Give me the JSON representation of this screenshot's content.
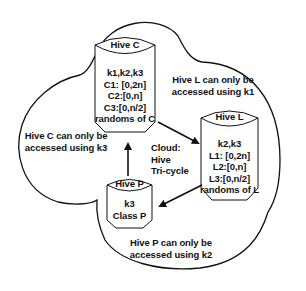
{
  "diagram": {
    "cloud_label": [
      "Cloud:",
      "Hive",
      "Tri-cycle"
    ],
    "hives": [
      {
        "id": "C",
        "title": "Hive C",
        "contents": [
          "k1,k2,k3",
          "C1: [0,2n]",
          "C2:[0,n]",
          "C3:[0,n/2]",
          "randoms of C"
        ]
      },
      {
        "id": "L",
        "title": "Hive L",
        "contents": [
          "k2,k3",
          "L1: [0,2n]",
          "L2:[0,n]",
          "L3:[0,n/2]",
          "randoms of L"
        ]
      },
      {
        "id": "P",
        "title": "Hive P",
        "contents": [
          "k3",
          "Class P"
        ]
      }
    ],
    "access_notes": {
      "hive_l": [
        "Hive L can only be",
        "accessed using k1"
      ],
      "hive_c": [
        "Hive C can only be",
        "accessed using k3"
      ],
      "hive_p": [
        "Hive P can only be",
        "accessed using k2"
      ]
    },
    "edges": [
      {
        "from": "Hive C",
        "to": "Hive L"
      },
      {
        "from": "Hive L",
        "to": "Hive P"
      },
      {
        "from": "Hive P",
        "to": "Hive C"
      }
    ],
    "colors": {
      "stroke": "#111111",
      "background": "#ffffff"
    }
  }
}
